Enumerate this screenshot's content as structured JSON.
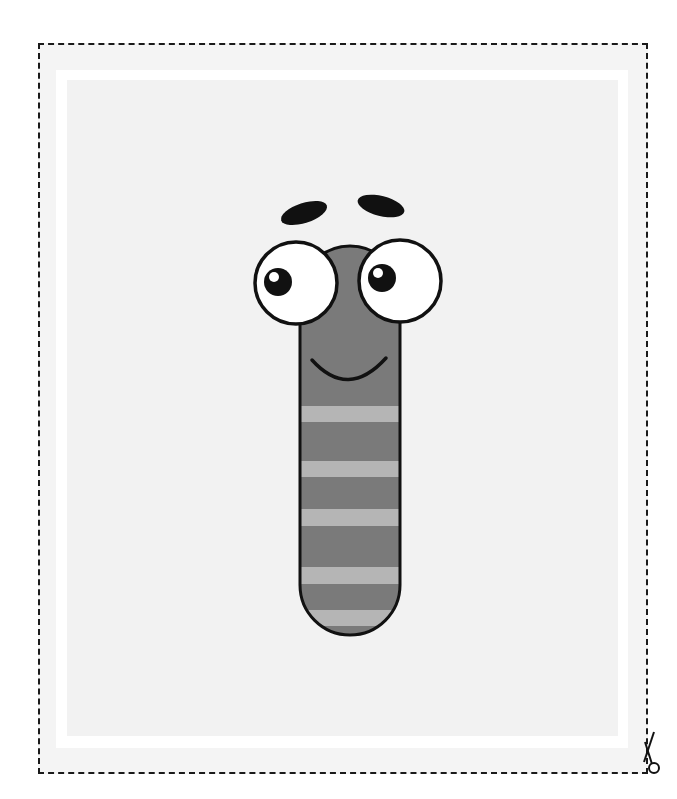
{
  "page": {
    "title": ""
  },
  "card": {
    "border_style": "dashed cut line",
    "scissors_icon": "scissors-icon"
  },
  "character": {
    "name": "worm",
    "body_color": "#7a7a7a",
    "stripe_color": "#b5b5b5",
    "outline_color": "#111111",
    "stripes": 5,
    "expression": "smile"
  },
  "colors": {
    "outer_background": "#f4f4f4",
    "frame": "#ffffff",
    "panel": "#f2f2f2",
    "cut_line": "#1a1a1a"
  }
}
